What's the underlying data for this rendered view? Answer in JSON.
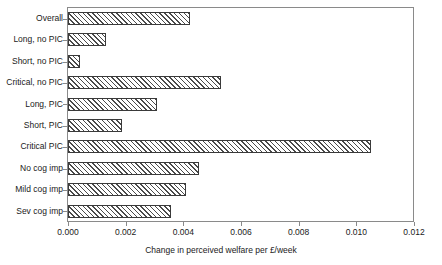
{
  "chart_data": {
    "type": "bar",
    "orientation": "horizontal",
    "title": "",
    "xlabel": "Change in perceived welfare per £/week",
    "ylabel": "",
    "xlim": [
      0.0,
      0.012
    ],
    "xticks": [
      "0.000",
      "0.002",
      "0.004",
      "0.006",
      "0.008",
      "0.010",
      "0.012"
    ],
    "xtick_values": [
      0.0,
      0.002,
      0.004,
      0.006,
      0.008,
      0.01,
      0.012
    ],
    "grid": false,
    "legend": null,
    "categories": [
      "Overall",
      "Long, no PIC",
      "Short, no PIC",
      "Critical, no PIC",
      "Long, PIC",
      "Short, PIC",
      "Critical PIC",
      "No cog imp",
      "Mild cog imp",
      "Sev cog imp"
    ],
    "values": [
      0.00424,
      0.00133,
      0.0004,
      0.00531,
      0.0031,
      0.00189,
      0.01051,
      0.00455,
      0.0041,
      0.00358
    ]
  }
}
